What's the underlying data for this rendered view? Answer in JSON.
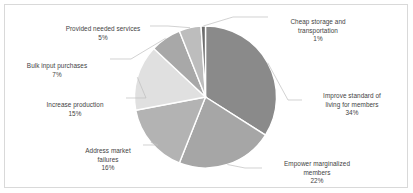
{
  "chart_data": {
    "type": "pie",
    "title": "",
    "legend_position": "none",
    "labels_outside": true,
    "categories": [
      "Improve standard of living for members",
      "Empower marginalized members",
      "Address market failures",
      "Increase production",
      "Bulk input purchases",
      "Provided needed services",
      "Cheap storage and transportation"
    ],
    "values": [
      34,
      22,
      16,
      15,
      7,
      5,
      1
    ],
    "value_suffix": "%",
    "slices": [
      {
        "label": "Improve standard of living for members",
        "label_line1": "Improve standard of",
        "label_line2": "living for members",
        "value": 34,
        "value_text": "34%",
        "color": "#8a8a8a"
      },
      {
        "label": "Empower marginalized members",
        "label_line1": "Empower marginalized",
        "label_line2": "members",
        "value": 22,
        "value_text": "22%",
        "color": "#a6a6a6"
      },
      {
        "label": "Address market failures",
        "label_line1": "Address market",
        "label_line2": "failures",
        "value": 16,
        "value_text": "16%",
        "color": "#b3b3b3"
      },
      {
        "label": "Increase production",
        "label_line1": "Increase production",
        "label_line2": "",
        "value": 15,
        "value_text": "15%",
        "color": "#e0e0e0"
      },
      {
        "label": "Bulk input purchases",
        "label_line1": "Bulk input purchases",
        "label_line2": "",
        "value": 7,
        "value_text": "7%",
        "color": "#a8a8a8"
      },
      {
        "label": "Provided needed services",
        "label_line1": "Provided needed services",
        "label_line2": "",
        "value": 5,
        "value_text": "5%",
        "color": "#bdbdbd"
      },
      {
        "label": "Cheap storage and transportation",
        "label_line1": "Cheap storage and",
        "label_line2": "transportation",
        "value": 1,
        "value_text": "1%",
        "color": "#6e6e6e"
      }
    ],
    "colors": {
      "plot_background": "#ffffff",
      "border": "#d9d9d9",
      "leader_line": "#bfbfbf",
      "slice_outline": "#ffffff",
      "label_text": "#3f3f3f"
    }
  }
}
